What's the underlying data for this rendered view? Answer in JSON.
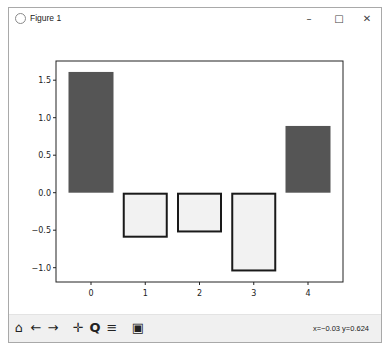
{
  "window": {
    "title": "Figure 1",
    "controls": {
      "minimize": "–",
      "maximize": "□",
      "close": "✕"
    }
  },
  "toolbar": {
    "buttons": [
      {
        "name": "home-button",
        "icon": "home-icon",
        "glyph": "⌂"
      },
      {
        "name": "back-button",
        "icon": "arrow-left-icon",
        "glyph": "←"
      },
      {
        "name": "forward-button",
        "icon": "arrow-right-icon",
        "glyph": "→"
      },
      {
        "name": "pan-button",
        "icon": "move-icon",
        "glyph": "✛"
      },
      {
        "name": "zoom-button",
        "icon": "magnifier-icon",
        "glyph": "Q"
      },
      {
        "name": "configure-subplots-button",
        "icon": "sliders-icon",
        "glyph": "≡"
      },
      {
        "name": "save-button",
        "icon": "floppy-disk-icon",
        "glyph": "▣"
      }
    ],
    "coords": "x=−0.03 y=0.624"
  },
  "chart_data": {
    "type": "bar",
    "categories": [
      "0",
      "1",
      "2",
      "3",
      "4"
    ],
    "values": [
      1.61,
      -0.6,
      -0.53,
      -1.05,
      0.89
    ],
    "title": "",
    "xlabel": "",
    "ylabel": "",
    "xticks": [
      "0",
      "1",
      "2",
      "3",
      "4"
    ],
    "yticks": [
      "1.5",
      "1.0",
      "0.5",
      "0.0",
      "−0.5",
      "−1.0"
    ],
    "ytick_values": [
      1.5,
      1.0,
      0.5,
      0.0,
      -0.5,
      -1.0
    ],
    "ylim": [
      -1.2,
      1.7
    ],
    "grid": false,
    "styles": {
      "positive": {
        "fill": "#555555",
        "edge": "none"
      },
      "negative": {
        "fill": "#f2f2f2",
        "edge": "#1a1a1a"
      }
    }
  }
}
